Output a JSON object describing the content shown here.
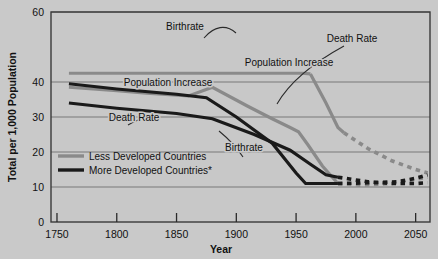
{
  "chart_data": {
    "type": "line",
    "title": "",
    "xlabel": "Year",
    "ylabel": "Total  per 1,000 Population",
    "xlim": [
      1745,
      2062
    ],
    "ylim": [
      0,
      60
    ],
    "xticks": [
      1750,
      1800,
      1850,
      1900,
      1950,
      2000,
      2050
    ],
    "yticks": [
      0,
      10,
      20,
      30,
      40,
      60
    ],
    "ytick_labels": [
      "0",
      "10",
      "20",
      "30",
      "40",
      "60"
    ],
    "gridlines_y": [
      10,
      20,
      30,
      40,
      60
    ],
    "grid": true,
    "legend_position": "inside lower-left",
    "colors": {
      "less_developed": "#8a8a8a",
      "more_developed": "#1a1a1a",
      "background": "#c9c9c9",
      "plot_background": "#c8c8c8",
      "gridline": "#6f6f6f",
      "axis": "#2a2a2a"
    },
    "legend": [
      {
        "name": "Less Developed Countries",
        "color": "#8a8a8a"
      },
      {
        "name": "More Developed Countries*",
        "color": "#1a1a1a"
      }
    ],
    "series": [
      {
        "name": "Less Developed Countries Birthrate",
        "group": "Less Developed Countries",
        "color": "#8a8a8a",
        "style": "solid",
        "x": [
          1760,
          1800,
          1850,
          1880,
          1920,
          1955,
          1962
        ],
        "y": [
          42.5,
          42.5,
          42.5,
          42.5,
          42.5,
          42.5,
          42.3
        ]
      },
      {
        "name": "Less Developed Countries Birthrate (decline)",
        "group": "Less Developed Countries",
        "color": "#8a8a8a",
        "style": "solid",
        "x": [
          1962,
          1975,
          1985,
          1990
        ],
        "y": [
          42.3,
          34.0,
          27.0,
          25.5
        ]
      },
      {
        "name": "Less Developed Countries Birthrate (projection)",
        "group": "Less Developed Countries",
        "color": "#8a8a8a",
        "style": "dashed",
        "x": [
          1990,
          2010,
          2030,
          2050,
          2060
        ],
        "y": [
          25.5,
          21.0,
          17.5,
          15.0,
          14.0
        ]
      },
      {
        "name": "Less Developed Countries Death Rate",
        "group": "Less Developed Countries",
        "color": "#8a8a8a",
        "style": "solid",
        "x": [
          1760,
          1800,
          1825,
          1860,
          1880,
          1910,
          1930,
          1945,
          1952,
          1960,
          1972,
          1985
        ],
        "y": [
          38.5,
          37.5,
          36.8,
          36.0,
          38.5,
          33.0,
          29.5,
          27.0,
          25.8,
          22.0,
          16.0,
          11.0
        ]
      },
      {
        "name": "Less Developed Countries Death Rate (projection)",
        "group": "Less Developed Countries",
        "color": "#8a8a8a",
        "style": "dashed",
        "x": [
          1985,
          2005,
          2030,
          2050,
          2060
        ],
        "y": [
          11.0,
          10.5,
          11.0,
          12.2,
          12.8
        ]
      },
      {
        "name": "More Developed Countries Birthrate",
        "group": "More Developed Countries",
        "color": "#1a1a1a",
        "style": "solid",
        "x": [
          1760,
          1800,
          1850,
          1875,
          1900,
          1930,
          1950,
          1958,
          1985
        ],
        "y": [
          39.5,
          38.0,
          36.5,
          35.5,
          30.0,
          22.5,
          14.0,
          11.0,
          11.0
        ]
      },
      {
        "name": "More Developed Countries Birthrate (projection)",
        "group": "More Developed Countries",
        "color": "#1a1a1a",
        "style": "dashed",
        "x": [
          1985,
          2010,
          2035,
          2050,
          2060
        ],
        "y": [
          11.0,
          11.2,
          11.5,
          12.5,
          13.5
        ]
      },
      {
        "name": "More Developed Countries Death Rate",
        "group": "More Developed Countries",
        "color": "#1a1a1a",
        "style": "solid",
        "x": [
          1760,
          1800,
          1850,
          1880,
          1915,
          1945,
          1962,
          1975,
          1985
        ],
        "y": [
          34.0,
          32.5,
          31.0,
          29.5,
          25.0,
          20.5,
          16.5,
          13.5,
          12.8
        ]
      },
      {
        "name": "More Developed Countries Death Rate (projection)",
        "group": "More Developed Countries",
        "color": "#1a1a1a",
        "style": "dashed",
        "x": [
          1985,
          2010,
          2030,
          2050,
          2060
        ],
        "y": [
          12.8,
          11.5,
          11.0,
          11.0,
          11.2
        ]
      }
    ],
    "annotations": [
      {
        "text": "Birthrate",
        "x_px": 185,
        "y_px": 30
      },
      {
        "text": "Death Rate",
        "x_px": 352,
        "y_px": 42
      },
      {
        "text": "Population Increase",
        "x_px": 289,
        "y_px": 66
      },
      {
        "text": "Population Increase",
        "x_px": 168,
        "y_px": 86
      },
      {
        "text": "Death Rate",
        "x_px": 134,
        "y_px": 121
      },
      {
        "text": "Birthrate",
        "x_px": 244,
        "y_px": 151
      }
    ]
  }
}
